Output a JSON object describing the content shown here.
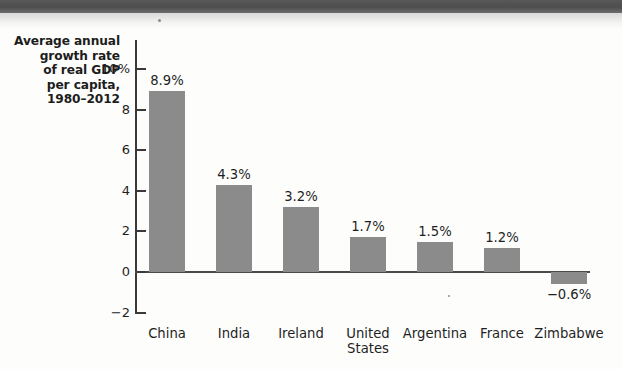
{
  "figure": {
    "axis_title_lines": [
      "Average annual",
      "growth rate",
      "of real GDP",
      "per capita,",
      "1980–2012"
    ]
  },
  "chart_data": {
    "type": "bar",
    "title": "",
    "subtitle": "",
    "xlabel": "",
    "ylabel": "Average annual growth rate of real GDP per capita, 1980–2012",
    "categories": [
      "China",
      "India",
      "Ireland",
      "United States",
      "Argentina",
      "France",
      "Zimbabwe"
    ],
    "category_label_lines": [
      [
        "China"
      ],
      [
        "India"
      ],
      [
        "Ireland"
      ],
      [
        "United",
        "States"
      ],
      [
        "Argentina"
      ],
      [
        "France"
      ],
      [
        "Zimbabwe"
      ]
    ],
    "values": [
      8.9,
      4.3,
      3.2,
      1.7,
      1.5,
      1.2,
      -0.6
    ],
    "value_labels": [
      "8.9%",
      "4.3%",
      "3.2%",
      "1.7%",
      "1.5%",
      "1.2%",
      "−0.6%"
    ],
    "ylim": [
      -2,
      10
    ],
    "yticks": [
      10,
      8,
      6,
      4,
      2,
      0,
      -2
    ],
    "ytick_labels": [
      "10%",
      "8",
      "6",
      "4",
      "2",
      "0",
      "−2"
    ],
    "grid": false,
    "legend": null,
    "bar_color": "#8b8b8b",
    "axis_color": "#3a3a3a",
    "text_color": "#1f1f1f"
  }
}
